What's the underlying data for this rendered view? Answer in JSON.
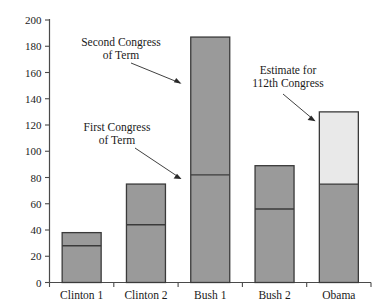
{
  "chart_data": {
    "type": "bar",
    "title": "",
    "xlabel": "",
    "ylabel": "",
    "ylim": [
      0,
      200
    ],
    "ytick_step": 20,
    "yticks": [
      0,
      20,
      40,
      60,
      80,
      100,
      120,
      140,
      160,
      180,
      200
    ],
    "ytick_labels": [
      "0",
      "20",
      "40",
      "60",
      "80",
      "100",
      "120",
      "140",
      "160",
      "180",
      "200"
    ],
    "grid": false,
    "legend": "none",
    "categories": [
      "Clinton 1",
      "Clinton 2",
      "Bush 1",
      "Bush 2",
      "Obama"
    ],
    "values": [
      38,
      75,
      187,
      89,
      130
    ],
    "series": [
      {
        "name": "First Congress of Term",
        "values": [
          28,
          44,
          82,
          56,
          75
        ]
      },
      {
        "name": "Second Congress of Term",
        "values": [
          10,
          31,
          105,
          33,
          55
        ]
      }
    ],
    "bars": [
      {
        "category": "Clinton 1",
        "total": 38,
        "first_congress": 28,
        "second_congress": 10,
        "divider_at": 28,
        "estimated": false
      },
      {
        "category": "Clinton 2",
        "total": 75,
        "first_congress": 44,
        "second_congress": 31,
        "divider_at": 44,
        "estimated": false
      },
      {
        "category": "Bush 1",
        "total": 187,
        "first_congress": 82,
        "second_congress": 105,
        "divider_at": 82,
        "estimated": false
      },
      {
        "category": "Bush 2",
        "total": 89,
        "first_congress": 56,
        "second_congress": 33,
        "divider_at": 56,
        "estimated": false
      },
      {
        "category": "Obama",
        "total": 130,
        "first_congress": 75,
        "second_congress": 55,
        "divider_at": 75,
        "estimated": true
      }
    ],
    "annotations": [
      {
        "id": "second-congress",
        "line1": "Second Congress",
        "line2": "of Term"
      },
      {
        "id": "first-congress",
        "line1": "First Congress",
        "line2": "of Term"
      },
      {
        "id": "estimate",
        "line1": "Estimate for",
        "line2": "112th Congress"
      }
    ],
    "colors": {
      "bar_fill": "#9a9a9a",
      "bar_fill_estimate": "#e9e9e9",
      "bar_stroke": "#3a3a3a",
      "axis": "#4a4a4a",
      "text": "#1a1a1a",
      "background": "#ffffff"
    }
  }
}
